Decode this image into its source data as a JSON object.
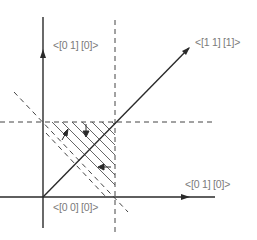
{
  "labels": {
    "y_axis": "<[0 1] [0]>",
    "diagonal": "<[1 1] [1]>",
    "x_axis": "<[0 1] [0]>",
    "origin": "<[0 0] [0]>"
  },
  "colors": {
    "line": "#2a2a2a",
    "dashed": "#444444",
    "hatch": "#555555",
    "label": "#7a7a7a"
  }
}
